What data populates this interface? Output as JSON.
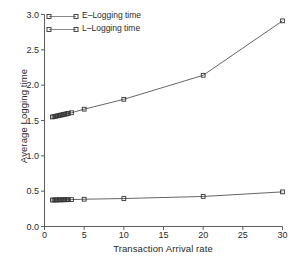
{
  "chart_data": {
    "type": "line",
    "title": "",
    "xlabel": "Transaction Arrival rate",
    "ylabel": "Average Logging time",
    "xlim": [
      0,
      30
    ],
    "ylim": [
      0.0,
      3.0
    ],
    "xticks": [
      0,
      5,
      10,
      15,
      20,
      25,
      30
    ],
    "xtick_labels": [
      "0",
      "5",
      "10",
      "15",
      "20",
      "25",
      "30"
    ],
    "yticks": [
      0.0,
      0.5,
      1.0,
      1.5,
      2.0,
      2.5,
      3.0
    ],
    "ytick_labels": [
      "0.0",
      "0.5",
      "1.0",
      "1.5",
      "2.0",
      "2.5",
      "3.0"
    ],
    "grid": false,
    "legend_position": "upper left",
    "marker": "open-square",
    "line_color": "#555555",
    "marker_color": "#333333",
    "series": [
      {
        "name": "E-Logging time",
        "label": "E–Logging time",
        "x": [
          1.0,
          1.2,
          1.4,
          1.6,
          1.8,
          2.0,
          2.2,
          2.4,
          2.6,
          2.8,
          3.0,
          3.4,
          5.0,
          10.0,
          20.0,
          30.0
        ],
        "y": [
          1.55,
          1.555,
          1.56,
          1.565,
          1.57,
          1.575,
          1.58,
          1.585,
          1.59,
          1.595,
          1.6,
          1.61,
          1.66,
          1.8,
          2.14,
          2.91
        ]
      },
      {
        "name": "L-Logging time",
        "label": "L–Logging time",
        "x": [
          1.0,
          1.2,
          1.4,
          1.6,
          1.8,
          2.0,
          2.2,
          2.4,
          2.6,
          2.8,
          3.0,
          3.4,
          5.0,
          10.0,
          20.0,
          30.0
        ],
        "y": [
          0.375,
          0.375,
          0.376,
          0.376,
          0.377,
          0.377,
          0.378,
          0.378,
          0.379,
          0.379,
          0.38,
          0.381,
          0.386,
          0.396,
          0.425,
          0.49
        ]
      }
    ]
  },
  "legend": {
    "items": [
      {
        "label": "E–Logging time"
      },
      {
        "label": "L–Logging time"
      }
    ]
  },
  "axes": {
    "x_title": "Transaction Arrival rate",
    "y_title": "Average Logging time"
  }
}
